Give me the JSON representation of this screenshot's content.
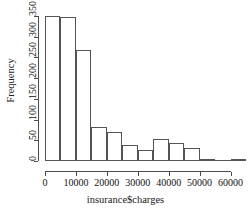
{
  "chart_data": {
    "type": "bar",
    "title": "",
    "subtitle": "",
    "xlabel": "insurance$charges",
    "ylabel": "Frequency",
    "grid": false,
    "legend": false,
    "legend_position": "none",
    "bin_width": 5000,
    "bin_edges": [
      0,
      5000,
      10000,
      15000,
      20000,
      25000,
      30000,
      35000,
      40000,
      45000,
      50000,
      55000,
      60000,
      65000
    ],
    "categories": [
      "0-5000",
      "5000-10000",
      "10000-15000",
      "15000-20000",
      "20000-25000",
      "25000-30000",
      "30000-35000",
      "35000-40000",
      "40000-45000",
      "45000-50000",
      "50000-55000",
      "55000-60000",
      "60000-65000"
    ],
    "values": [
      350,
      347,
      268,
      82,
      70,
      38,
      27,
      53,
      43,
      31,
      1,
      0,
      3
    ],
    "xlim": [
      0,
      65000
    ],
    "ylim": [
      0,
      350
    ],
    "xticks": [
      0,
      10000,
      20000,
      30000,
      40000,
      50000,
      60000
    ],
    "xtick_labels": [
      "0",
      "10000",
      "20000",
      "30000",
      "40000",
      "50000",
      "60000"
    ],
    "yticks": [
      0,
      50,
      100,
      150,
      200,
      250,
      300,
      350
    ],
    "ytick_labels": [
      "0",
      "50",
      "100",
      "150",
      "200",
      "250",
      "300",
      "350"
    ],
    "bar_fill_color": "#ffffff",
    "bar_border_color": "#545454",
    "axis_color": "#4d4d4d",
    "text_color": "#111111",
    "background_color": "#ffffff"
  }
}
